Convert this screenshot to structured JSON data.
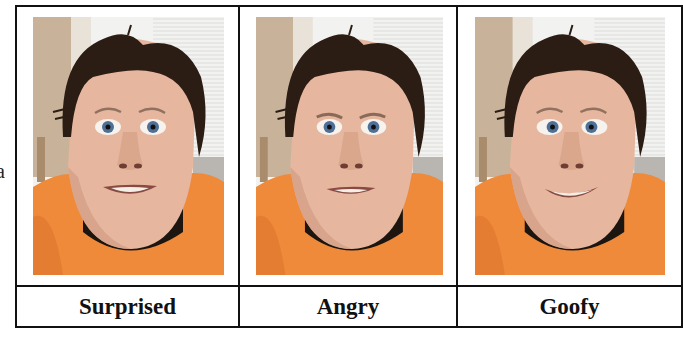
{
  "stray_text": "a",
  "panels": [
    {
      "label": "Surprised",
      "expression": "surprised",
      "eye_shift": 0,
      "mouth": "grin-teeth"
    },
    {
      "label": "Angry",
      "expression": "angry",
      "eye_shift": 0,
      "mouth": "flat-grin"
    },
    {
      "label": "Goofy",
      "expression": "goofy",
      "eye_shift": 3,
      "mouth": "wide-smile"
    }
  ],
  "colors": {
    "border": "#111111",
    "shirt": "#EE8A3A",
    "shirt_shadow": "#D9702A",
    "collar": "#1C1510",
    "skin": "#E6B79E",
    "skin_shadow": "#CF9A80",
    "hair": "#2B1C14",
    "wall": "#C8B39A",
    "window": "#F2F2F0",
    "blinds": "#DCDCDA",
    "iris": "#4F6F96"
  }
}
